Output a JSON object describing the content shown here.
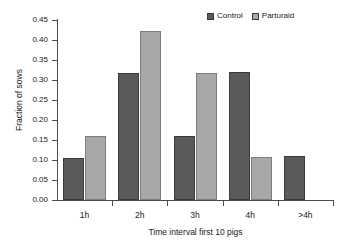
{
  "chart_data": {
    "type": "bar",
    "title": "",
    "xlabel": "Time interval first 10 pigs",
    "ylabel": "Fraction of sows",
    "categories": [
      "1h",
      "2h",
      "3h",
      "4h",
      ">4h"
    ],
    "series": [
      {
        "name": "Control",
        "color": "#5a5a5a",
        "values": [
          0.105,
          0.317,
          0.16,
          0.319,
          0.109
        ]
      },
      {
        "name": "Parturaid",
        "color": "#a8a8a8",
        "values": [
          0.159,
          0.422,
          0.318,
          0.108,
          0.0
        ]
      }
    ],
    "ylim": [
      0.0,
      0.45
    ],
    "ytick_step": 0.05,
    "yticks": [
      0.0,
      0.05,
      0.1,
      0.15,
      0.2,
      0.25,
      0.3,
      0.35,
      0.4,
      0.45
    ],
    "ytick_labels": [
      "0.00",
      "0.05",
      "0.10",
      "0.15",
      "0.20",
      "0.25",
      "0.30",
      "0.35",
      "0.40",
      "0.45"
    ],
    "grid": false,
    "legend_position": "top-right",
    "legend": [
      "Control",
      "Parturaid"
    ]
  },
  "legend": {
    "entries": [
      {
        "label": "Control",
        "color": "#5a5a5a"
      },
      {
        "label": "Parturaid",
        "color": "#a8a8a8"
      }
    ]
  },
  "axes": {
    "x_title": "Time interval first 10 pigs",
    "y_title": "Fraction of sows"
  }
}
